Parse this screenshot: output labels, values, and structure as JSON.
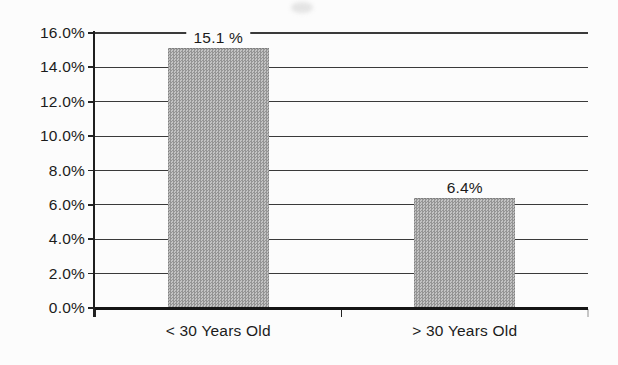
{
  "page": {
    "background_color": "#fcfcfc",
    "text_color": "#1b1b1b",
    "axis_color": "#1f1f1f",
    "gridline_color": "#3a3a3a"
  },
  "chart_data": {
    "type": "bar",
    "title": "",
    "xlabel": "",
    "ylabel": "",
    "categories": [
      "< 30 Years Old",
      "> 30 Years Old"
    ],
    "values": [
      15.1,
      6.4
    ],
    "bar_labels": [
      "15.1 %",
      "6.4%"
    ],
    "ylim": [
      0,
      16
    ],
    "y_tick_step": 2,
    "y_ticks": [
      "0.0%",
      "2.0%",
      "4.0%",
      "6.0%",
      "8.0%",
      "10.0%",
      "12.0%",
      "14.0%",
      "16.0%"
    ],
    "grid": true,
    "legend": false,
    "bar_color": "#a8a8a8",
    "bar_dither_dark": "#949494",
    "bar_dither_light": "#c3c3c3"
  }
}
